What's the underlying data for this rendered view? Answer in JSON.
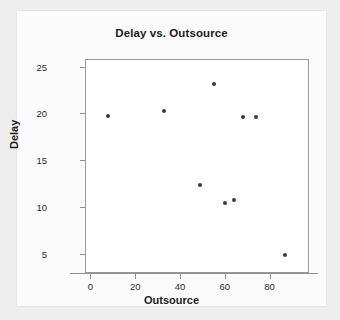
{
  "chart_data": {
    "type": "scatter",
    "title": "Delay vs. Outsource",
    "xlabel": "Outsource",
    "ylabel": "Delay",
    "xlim": [
      -10,
      90
    ],
    "ylim": [
      3,
      25.8
    ],
    "xticks": [
      0,
      20,
      40,
      60,
      80
    ],
    "yticks": [
      5,
      10,
      15,
      20,
      25
    ],
    "xtick_labels": [
      "0",
      "20",
      "40",
      "60",
      "80"
    ],
    "ytick_labels": [
      "5",
      "10",
      "15",
      "20",
      "25"
    ],
    "grid": false,
    "legend": false,
    "marker": "filled-circle",
    "marker_color": "#3a3a3a",
    "points": [
      {
        "x": 0,
        "y": 19.8
      },
      {
        "x": 25,
        "y": 20.4
      },
      {
        "x": 41,
        "y": 12.5
      },
      {
        "x": 47,
        "y": 23.2
      },
      {
        "x": 52,
        "y": 10.6
      },
      {
        "x": 56,
        "y": 10.9
      },
      {
        "x": 60,
        "y": 19.7
      },
      {
        "x": 66,
        "y": 19.7
      },
      {
        "x": 79,
        "y": 5.0
      }
    ]
  },
  "colors": {
    "page_background": "#eeeeee",
    "card_background": "#fbfbfb",
    "plot_background": "#ffffff",
    "axis": "#8f8f8f",
    "text": "#1b1b1b",
    "marker": "#3a3a3a"
  }
}
